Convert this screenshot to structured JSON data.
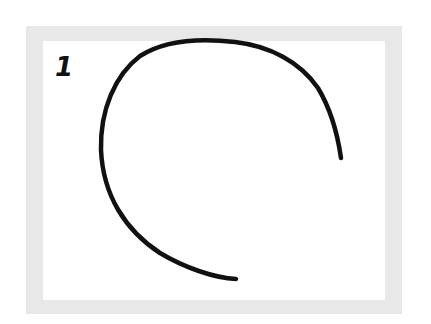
{
  "figure": {
    "label": "1",
    "frame_color": "#e8e8e8",
    "panel_color": "#ffffff",
    "stroke_color": "#111111",
    "shape": "open-arc-curve"
  }
}
